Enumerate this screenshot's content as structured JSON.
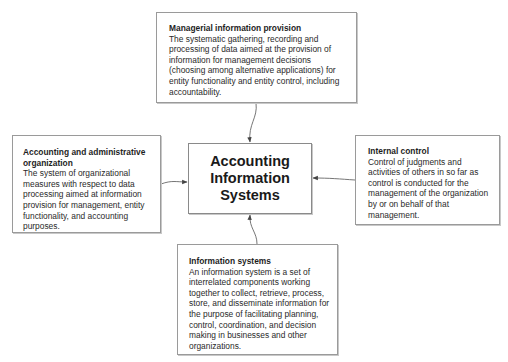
{
  "center": {
    "title": "Accounting Information Systems"
  },
  "boxes": {
    "top": {
      "title": "Managerial information provision",
      "body": "The systematic gathering, recording and processing of data aimed at the provision of information for management decisions (choosing among alternative applications) for entity functionality and entity control, including accountability."
    },
    "left": {
      "title": "Accounting and administrative organization",
      "body": "The system of organizational measures with respect to data processing aimed at information provision for management, entity functionality, and accounting purposes."
    },
    "right": {
      "title": "Internal control",
      "body": "Control of judgments and activities of others in so far as control is conducted for the management of the organization by or on behalf of that management."
    },
    "bottom": {
      "title": "Information systems",
      "body": "An information system is a set of interrelated components working together to collect, retrieve, process, store, and disseminate information for the purpose of facilitating planning, control, coordination, and decision making in businesses and other organizations."
    }
  },
  "colors": {
    "border": "#9a9a9a",
    "arrow": "#555555",
    "text": "#222222"
  }
}
